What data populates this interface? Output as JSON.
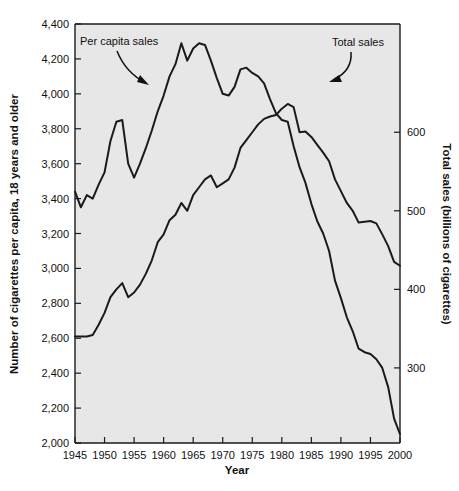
{
  "chart_data": {
    "type": "line",
    "title": "",
    "xlabel": "Year",
    "ylabel": "Number of cigarettes per capita, 18 years and older",
    "y2label": "Total sales (billions of cigarettes)",
    "xlim": [
      1945,
      2000
    ],
    "ylim": [
      2000,
      4400
    ],
    "y2lim": [
      204.4,
      737.8
    ],
    "grid": false,
    "legend_position": "inline-annotations",
    "xticks": [
      1945,
      1950,
      1955,
      1960,
      1965,
      1970,
      1975,
      1980,
      1985,
      1990,
      1995,
      2000
    ],
    "xtick_labels": [
      "1945",
      "1950",
      "1955",
      "1960",
      "1965",
      "1970",
      "1975",
      "1980",
      "1985",
      "1990",
      "1995",
      "2000"
    ],
    "yticks": [
      2000,
      2200,
      2400,
      2600,
      2800,
      3000,
      3200,
      3400,
      3600,
      3800,
      4000,
      4200,
      4400
    ],
    "ytick_labels": [
      "2,000",
      "2,200",
      "2,400",
      "2,600",
      "2,800",
      "3,000",
      "3,200",
      "3,400",
      "3,600",
      "3,800",
      "4,000",
      "4,200",
      "4,400"
    ],
    "y2ticks": [
      300,
      400,
      500,
      600
    ],
    "y2tick_labels": [
      "300",
      "400",
      "500",
      "600"
    ],
    "annotations": [
      {
        "text": "Per capita sales",
        "x": 1947.0,
        "y": 4330
      },
      {
        "text": "Total sales",
        "x": 1988.0,
        "y": 4330
      }
    ],
    "series": [
      {
        "name": "Per capita sales",
        "axis": "left",
        "units": "cigarettes per capita, 18+",
        "x": [
          1945,
          1946,
          1947,
          1948,
          1949,
          1950,
          1951,
          1952,
          1953,
          1954,
          1955,
          1956,
          1957,
          1958,
          1959,
          1960,
          1961,
          1962,
          1963,
          1964,
          1965,
          1966,
          1967,
          1968,
          1969,
          1970,
          1971,
          1972,
          1973,
          1974,
          1975,
          1976,
          1977,
          1978,
          1979,
          1980,
          1981,
          1982,
          1983,
          1984,
          1985,
          1986,
          1987,
          1988,
          1989,
          1990,
          1991,
          1992,
          1993,
          1994,
          1995,
          1996,
          1997,
          1998,
          1999,
          2000
        ],
        "values": [
          3440,
          3350,
          3420,
          3400,
          3480,
          3550,
          3730,
          3840,
          3850,
          3600,
          3520,
          3600,
          3690,
          3790,
          3900,
          3990,
          4100,
          4170,
          4290,
          4190,
          4260,
          4290,
          4280,
          4190,
          4090,
          4000,
          3990,
          4040,
          4140,
          4150,
          4120,
          4100,
          4060,
          3970,
          3890,
          3850,
          3840,
          3700,
          3580,
          3490,
          3370,
          3270,
          3200,
          3100,
          2930,
          2830,
          2720,
          2640,
          2540,
          2520,
          2510,
          2480,
          2430,
          2320,
          2140,
          2050
        ]
      },
      {
        "name": "Total sales",
        "axis": "right",
        "units": "billions of cigarettes",
        "x": [
          1945,
          1946,
          1947,
          1948,
          1949,
          1950,
          1951,
          1952,
          1953,
          1954,
          1955,
          1956,
          1957,
          1958,
          1959,
          1960,
          1961,
          1962,
          1963,
          1964,
          1965,
          1966,
          1967,
          1968,
          1969,
          1970,
          1971,
          1972,
          1973,
          1974,
          1975,
          1976,
          1977,
          1978,
          1979,
          1980,
          1981,
          1982,
          1983,
          1984,
          1985,
          1986,
          1987,
          1988,
          1989,
          1990,
          1991,
          1992,
          1993,
          1994,
          1995,
          1996,
          1997,
          1998,
          1999,
          2000
        ],
        "values": [
          340,
          340,
          340,
          342,
          355,
          370,
          390,
          400,
          408,
          390,
          396,
          406,
          420,
          437,
          460,
          470,
          488,
          495,
          510,
          500,
          520,
          530,
          540,
          545,
          530,
          535,
          540,
          555,
          580,
          590,
          600,
          610,
          617,
          620,
          622,
          630,
          636,
          632,
          600,
          601,
          594,
          584,
          574,
          563,
          540,
          525,
          510,
          500,
          485,
          486,
          487,
          484,
          470,
          455,
          435,
          430
        ]
      }
    ]
  },
  "axes": {
    "x_title": "Year",
    "y_left_title": "Number of cigarettes per capita, 18 years and older",
    "y_right_title": "Total sales (billions of cigarettes)"
  }
}
